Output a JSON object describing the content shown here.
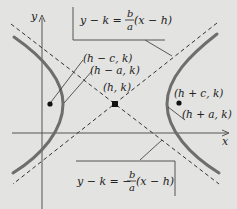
{
  "diagram": {
    "axes": {
      "x_label": "x",
      "y_label": "y"
    },
    "points": {
      "center": "(h, k)",
      "left_focus": "(h − c, k)",
      "left_vertex": "(h − a, k)",
      "right_focus": "(h + c, k)",
      "right_vertex": "(h + a, k)"
    },
    "asymptote_top": {
      "lhs": "y − k =",
      "frac_num": "b",
      "frac_den": "a",
      "rhs": "(x − h)"
    },
    "asymptote_bottom": {
      "lhs": "y − k = −",
      "frac_num": "b",
      "frac_den": "a",
      "rhs": "(x − h)"
    },
    "colors": {
      "background": "#e3e3e1",
      "curve": "#6e6e6e",
      "ink": "#222222"
    }
  }
}
